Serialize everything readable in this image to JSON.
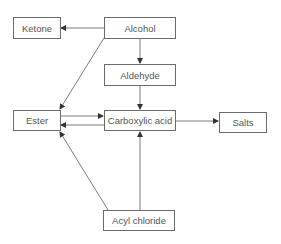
{
  "diagram": {
    "nodes": [
      {
        "id": "ketone",
        "label": "Ketone"
      },
      {
        "id": "alcohol",
        "label": "Alcohol"
      },
      {
        "id": "aldehyde",
        "label": "Aldehyde"
      },
      {
        "id": "ester",
        "label": "Ester"
      },
      {
        "id": "carboxylic_acid",
        "label": "Carboxylic acid"
      },
      {
        "id": "salts",
        "label": "Salts"
      },
      {
        "id": "acyl_chloride",
        "label": "Acyl chloride"
      }
    ],
    "edges": [
      {
        "from": "alcohol",
        "to": "ketone"
      },
      {
        "from": "alcohol",
        "to": "aldehyde"
      },
      {
        "from": "alcohol",
        "to": "ester"
      },
      {
        "from": "aldehyde",
        "to": "carboxylic_acid"
      },
      {
        "from": "ester",
        "to": "carboxylic_acid"
      },
      {
        "from": "carboxylic_acid",
        "to": "ester"
      },
      {
        "from": "carboxylic_acid",
        "to": "salts"
      },
      {
        "from": "acyl_chloride",
        "to": "ester"
      },
      {
        "from": "acyl_chloride",
        "to": "carboxylic_acid"
      }
    ],
    "colors": {
      "line": "#6b6b6b",
      "text": "#555555"
    }
  }
}
